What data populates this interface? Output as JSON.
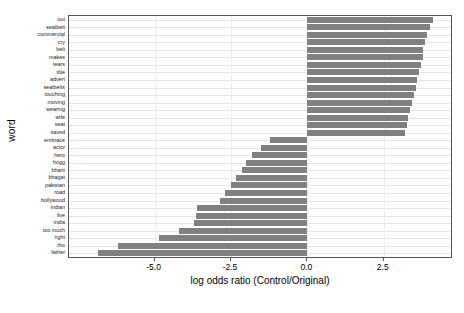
{
  "chart_data": {
    "type": "bar",
    "orientation": "horizontal",
    "title": "",
    "xlabel": "log odds ratio (Control/Original)",
    "ylabel": "word",
    "xlim": [
      -7.8,
      4.7
    ],
    "ylim": [
      0,
      40
    ],
    "grid": true,
    "legend": "none",
    "bar_color": "#808080",
    "categories": [
      "out",
      "seatbelt",
      "commercial",
      "cry",
      "belt",
      "makes",
      "tears",
      "title",
      "advert",
      "seatbelts",
      "touching",
      "moving",
      "wearing",
      "wife",
      "seat",
      "saved",
      "embrace",
      "actor",
      "hero",
      "hogg",
      "bharti",
      "bhagat",
      "pakistan",
      "road",
      "bollywood",
      "indian",
      "live",
      "india",
      "too much",
      "right",
      "rho",
      "father"
    ],
    "values": [
      4.11,
      4.02,
      3.93,
      3.84,
      3.78,
      3.78,
      3.72,
      3.66,
      3.6,
      3.54,
      3.48,
      3.42,
      3.36,
      3.3,
      3.27,
      3.21,
      -1.22,
      -1.52,
      -1.82,
      -2.02,
      -2.14,
      -2.32,
      -2.5,
      -2.68,
      -2.86,
      -3.6,
      -3.66,
      -3.72,
      -4.2,
      -4.86,
      -6.2,
      -6.85
    ],
    "xticks": [
      -5.0,
      -2.5,
      0.0,
      2.5
    ],
    "xtick_labels": [
      "-5.0",
      "-2.5",
      "0.0",
      "2.5"
    ]
  }
}
